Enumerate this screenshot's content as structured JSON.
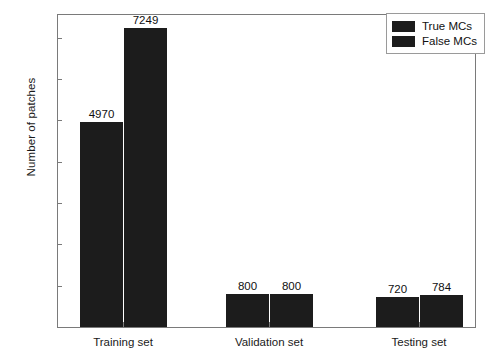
{
  "chart_data": {
    "type": "bar",
    "title": "",
    "xlabel": "",
    "ylabel": "Number of patches",
    "categories": [
      "Training set",
      "Validation set",
      "Testing set"
    ],
    "series": [
      {
        "name": "True MCs",
        "values": [
          4970,
          800,
          720
        ]
      },
      {
        "name": "False MCs",
        "values": [
          7249,
          800,
          784
        ]
      }
    ],
    "ylim": [
      0,
      7600
    ],
    "yticks": [
      0,
      1000,
      2000,
      3000,
      4000,
      5000,
      6000,
      7000
    ],
    "ytick_labels": [
      "0",
      "1000",
      "2000",
      "3000",
      "4000",
      "5000",
      "6000",
      "7000"
    ],
    "bar_labels": [
      [
        "4970",
        "800",
        "720"
      ],
      [
        "7249",
        "800",
        "784"
      ]
    ],
    "grid": false,
    "legend_position": "upper right",
    "bar_color": "#1c1c1c",
    "axis_color": "#7a7a7a",
    "text_color": "#1a1a1a",
    "background": "#ffffff"
  },
  "legend": {
    "entries": [
      {
        "label": "True MCs"
      },
      {
        "label": "False MCs"
      }
    ]
  }
}
